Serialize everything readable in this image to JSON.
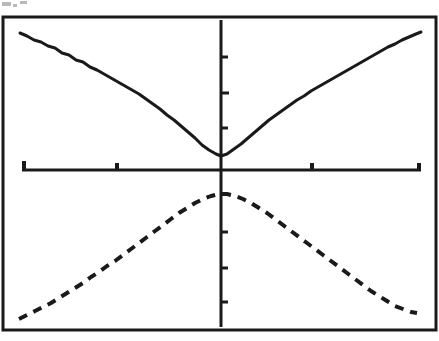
{
  "figure": {
    "title": "",
    "background_color": "#ffffff",
    "ink_color": "#1a1a1a",
    "frame": {
      "name": "plot-frame",
      "x": 3,
      "y": 17,
      "width": 433,
      "height": 313,
      "stroke_width": 3,
      "visible_edges": "all"
    },
    "axes": {
      "x_axis": {
        "label": "",
        "y_pixel": 170,
        "x_start": 22,
        "x_end": 421,
        "stroke_width": 3,
        "ticks": [
          {
            "x": 24,
            "height": 9,
            "label": ""
          },
          {
            "x": 117,
            "height": 7,
            "label": ""
          },
          {
            "x": 221,
            "height": 0,
            "label": ""
          },
          {
            "x": 312,
            "height": 7,
            "label": ""
          },
          {
            "x": 419,
            "height": 7,
            "label": ""
          }
        ]
      },
      "y_axis": {
        "label": "",
        "x_pixel": 221,
        "y_start": 20,
        "y_end": 327,
        "stroke_width": 3,
        "ticks": [
          {
            "y": 57,
            "width": 7,
            "label": ""
          },
          {
            "y": 93,
            "width": 8,
            "label": ""
          },
          {
            "y": 128,
            "width": 7,
            "label": ""
          },
          {
            "y": 232,
            "width": 7,
            "label": ""
          },
          {
            "y": 268,
            "width": 7,
            "label": ""
          },
          {
            "y": 302,
            "width": 7,
            "label": ""
          }
        ]
      }
    }
  },
  "chart_data": {
    "type": "line",
    "title": "",
    "subtitle": "",
    "xlabel": "",
    "ylabel": "",
    "xlim": [
      -1,
      1
    ],
    "ylim": [
      -1,
      1
    ],
    "grid": false,
    "legend_position": "none",
    "annotations": [],
    "origin_pixel": {
      "x": 221,
      "y": 170
    },
    "series": [
      {
        "name": "upper-solid-curve",
        "style": "solid",
        "description": "V-shaped curve with minimum just above the origin, opening upward, rising to both upper corners",
        "stroke_width": 3,
        "points_pixel": [
          [
            20,
            33
          ],
          [
            27,
            36
          ],
          [
            34,
            40
          ],
          [
            41,
            42
          ],
          [
            48,
            46
          ],
          [
            55,
            48
          ],
          [
            62,
            53
          ],
          [
            69,
            55
          ],
          [
            76,
            60
          ],
          [
            83,
            62
          ],
          [
            90,
            67
          ],
          [
            97,
            70
          ],
          [
            104,
            74
          ],
          [
            111,
            78
          ],
          [
            118,
            82
          ],
          [
            125,
            86
          ],
          [
            132,
            90
          ],
          [
            139,
            94
          ],
          [
            146,
            99
          ],
          [
            153,
            104
          ],
          [
            160,
            109
          ],
          [
            167,
            115
          ],
          [
            174,
            120
          ],
          [
            181,
            126
          ],
          [
            188,
            132
          ],
          [
            195,
            138
          ],
          [
            202,
            145
          ],
          [
            209,
            150
          ],
          [
            216,
            154
          ],
          [
            221,
            156
          ],
          [
            227,
            154
          ],
          [
            234,
            149
          ],
          [
            241,
            144
          ],
          [
            248,
            138
          ],
          [
            255,
            132
          ],
          [
            262,
            126
          ],
          [
            269,
            120
          ],
          [
            276,
            115
          ],
          [
            283,
            110
          ],
          [
            290,
            105
          ],
          [
            297,
            100
          ],
          [
            304,
            96
          ],
          [
            311,
            91
          ],
          [
            318,
            87
          ],
          [
            325,
            83
          ],
          [
            332,
            79
          ],
          [
            339,
            75
          ],
          [
            346,
            71
          ],
          [
            353,
            67
          ],
          [
            360,
            63
          ],
          [
            367,
            59
          ],
          [
            374,
            55
          ],
          [
            381,
            51
          ],
          [
            388,
            47
          ],
          [
            395,
            44
          ],
          [
            402,
            40
          ],
          [
            409,
            37
          ],
          [
            416,
            34
          ],
          [
            421,
            32
          ]
        ]
      },
      {
        "name": "lower-dashed-curve",
        "style": "dashed",
        "dash_pattern": "9 7",
        "description": "Inverted-V / hill-shaped curve with maximum just below the origin, falling to both lower corners",
        "stroke_width": 4,
        "points_pixel": [
          [
            19,
            319
          ],
          [
            27,
            315
          ],
          [
            35,
            311
          ],
          [
            43,
            307
          ],
          [
            51,
            303
          ],
          [
            59,
            298
          ],
          [
            67,
            293
          ],
          [
            75,
            288
          ],
          [
            83,
            283
          ],
          [
            91,
            277
          ],
          [
            99,
            272
          ],
          [
            107,
            266
          ],
          [
            115,
            261
          ],
          [
            123,
            255
          ],
          [
            131,
            249
          ],
          [
            139,
            243
          ],
          [
            147,
            237
          ],
          [
            155,
            231
          ],
          [
            163,
            225
          ],
          [
            171,
            219
          ],
          [
            179,
            213
          ],
          [
            187,
            208
          ],
          [
            195,
            203
          ],
          [
            203,
            199
          ],
          [
            211,
            196
          ],
          [
            219,
            194
          ],
          [
            227,
            194
          ],
          [
            235,
            196
          ],
          [
            243,
            199
          ],
          [
            251,
            203
          ],
          [
            259,
            208
          ],
          [
            267,
            213
          ],
          [
            275,
            219
          ],
          [
            283,
            225
          ],
          [
            291,
            231
          ],
          [
            299,
            237
          ],
          [
            307,
            243
          ],
          [
            315,
            249
          ],
          [
            323,
            255
          ],
          [
            331,
            261
          ],
          [
            339,
            267
          ],
          [
            347,
            273
          ],
          [
            355,
            279
          ],
          [
            363,
            285
          ],
          [
            371,
            291
          ],
          [
            379,
            296
          ],
          [
            387,
            301
          ],
          [
            395,
            306
          ],
          [
            403,
            309
          ],
          [
            411,
            312
          ],
          [
            417,
            313
          ]
        ]
      }
    ]
  },
  "artifacts": {
    "scan_specks": [
      {
        "name": "scan-speck-top-left-a",
        "x": 2,
        "y": 2,
        "width": 9,
        "height": 4
      },
      {
        "name": "scan-speck-top-left-b",
        "x": 20,
        "y": 1,
        "width": 7,
        "height": 3
      },
      {
        "name": "scan-speck-top-left-c",
        "x": 13,
        "y": 4,
        "width": 4,
        "height": 3
      }
    ]
  }
}
